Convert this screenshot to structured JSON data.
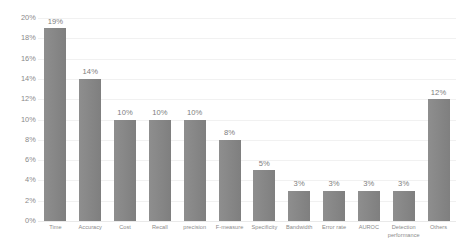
{
  "chart_data": {
    "type": "bar",
    "title": "",
    "subtitle": "",
    "xlabel": "",
    "ylabel": "",
    "ylim": [
      0,
      20
    ],
    "y_tick_step": 2,
    "y_tick_labels": [
      "20%",
      "18%",
      "16%",
      "14%",
      "12%",
      "10%",
      "8%",
      "6%",
      "4%",
      "2%",
      "0%"
    ],
    "grid": true,
    "grid_orientation": "horizontal",
    "legend": false,
    "legend_position": "none",
    "value_label_format": "percent-integer",
    "categories": [
      "Time",
      "Accuracy",
      "Cost",
      "Recall",
      "precision",
      "F-measure",
      "Specificity",
      "Bandwidth",
      "Error rate",
      "AUROC",
      "Detection performance",
      "Others"
    ],
    "values": [
      19,
      14,
      10,
      10,
      10,
      8,
      5,
      3,
      3,
      3,
      3,
      12
    ],
    "value_labels": [
      "19%",
      "14%",
      "10%",
      "10%",
      "10%",
      "8%",
      "5%",
      "3%",
      "3%",
      "3%",
      "3%",
      "12%"
    ]
  },
  "style": {
    "bar_color": "#878787",
    "gridline_color": "#f1f1f1",
    "axis_text_color": "#8a8a8a",
    "value_text_color": "#7d7d7d",
    "background_color": "#ffffff"
  }
}
